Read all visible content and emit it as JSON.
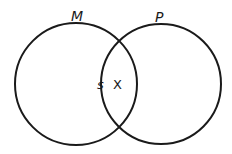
{
  "diagram": {
    "type": "venn",
    "stroke_color": "#1a1a1a",
    "background": "#ffffff",
    "circles": [
      {
        "label": "M",
        "cx": 76,
        "cy": 84,
        "r": 61
      },
      {
        "label": "P",
        "cx": 161,
        "cy": 84,
        "r": 60
      }
    ],
    "region_labels": {
      "s": "s",
      "x": "X"
    }
  }
}
